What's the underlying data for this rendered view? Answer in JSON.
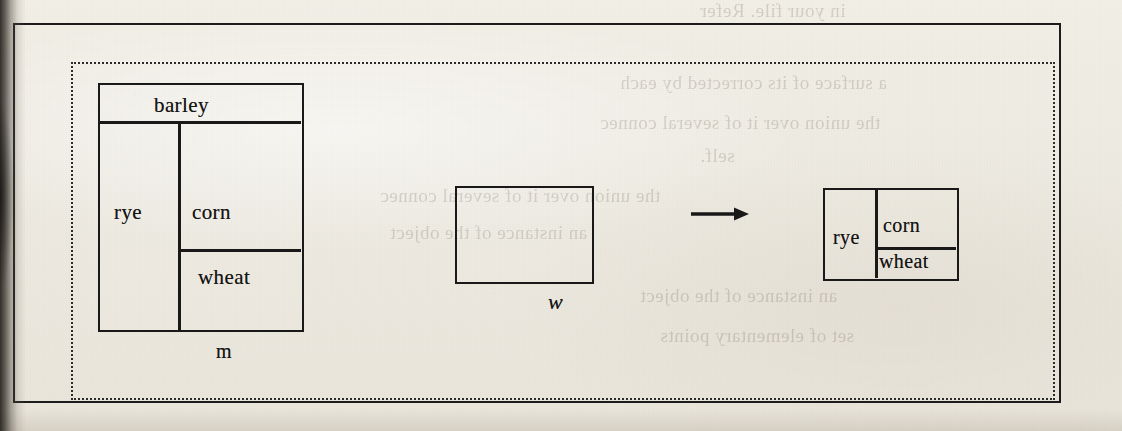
{
  "figure": {
    "caption": "",
    "background_color": "#efece4",
    "ink_color": "#181818",
    "frame": {
      "style": "solid-rectangle"
    },
    "inner_border": {
      "style": "dotted-rectangle"
    }
  },
  "diagram_left": {
    "name": "m",
    "label": "m",
    "cells": [
      {
        "id": "barley",
        "label": "barley"
      },
      {
        "id": "rye",
        "label": "rye"
      },
      {
        "id": "corn",
        "label": "corn"
      },
      {
        "id": "wheat",
        "label": "wheat"
      }
    ]
  },
  "diagram_middle": {
    "name": "w",
    "label": "w",
    "cells": []
  },
  "arrow": {
    "glyph": "→",
    "direction": "right"
  },
  "diagram_right": {
    "name": "result",
    "label": "",
    "cells": [
      {
        "id": "rye",
        "label": "rye"
      },
      {
        "id": "corn",
        "label": "corn"
      },
      {
        "id": "wheat",
        "label": "wheat"
      }
    ]
  },
  "bleed_through": {
    "lines": [
      "in your file. Refer",
      "a surface of its corrected by each",
      "the union over it of several connec",
      "self.",
      "an instance of the object",
      "set of elementary points"
    ]
  }
}
